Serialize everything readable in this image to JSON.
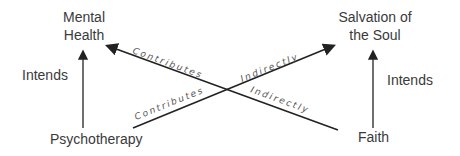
{
  "nodes": {
    "mental_health": "Mental Health",
    "mental_health_l1": "Mental",
    "mental_health_l2": "Health",
    "salvation_l1": "Salvation of",
    "salvation_l2": "the Soul",
    "psychotherapy": "Psychotherapy",
    "faith": "Faith"
  },
  "edges": {
    "left_intends": "Intends",
    "right_intends": "Intends",
    "psy_contributes": "Contributes",
    "faith_contributes": "Contributes",
    "psy_indirectly": "Indirectly",
    "faith_indirectly": "Indirectly"
  },
  "colors": {
    "line": "#222222",
    "text": "#3a3a3a"
  }
}
